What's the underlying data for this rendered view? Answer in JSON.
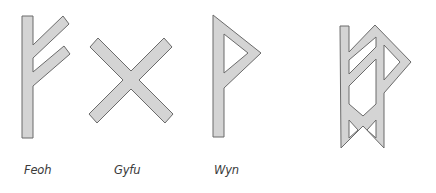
{
  "colors": {
    "fill": "#d4d4d4",
    "stroke": "#6b6b6b",
    "label": "#3a3a3a"
  },
  "runes": [
    {
      "name": "Feoh",
      "shape": "feoh-rune"
    },
    {
      "name": "Gyfu",
      "shape": "gyfu-rune"
    },
    {
      "name": "Wyn",
      "shape": "wyn-rune"
    },
    {
      "name": "",
      "shape": "bindrune-feoh-gyfu-wyn"
    }
  ],
  "labels": {
    "feoh": "Feoh",
    "gyfu": "Gyfu",
    "wyn": "Wyn"
  }
}
